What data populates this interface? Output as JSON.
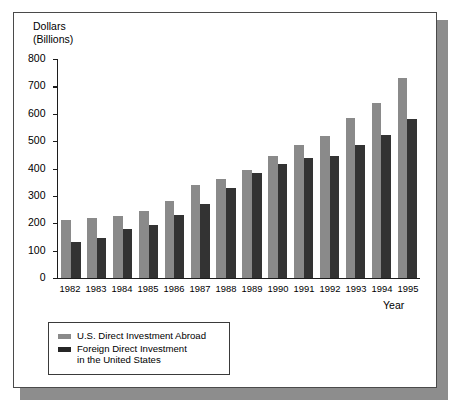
{
  "chart_data": {
    "type": "bar",
    "title": "",
    "subtitle": "",
    "xlabel": "Year",
    "ylabel": "Dollars\n(Billions)",
    "ylabel_line1": "Dollars",
    "ylabel_line2": "(Billions)",
    "categories": [
      "1982",
      "1983",
      "1984",
      "1985",
      "1986",
      "1987",
      "1988",
      "1989",
      "1990",
      "1991",
      "1992",
      "1993",
      "1994",
      "1995"
    ],
    "ylim": [
      0,
      800
    ],
    "yticks": [
      0,
      100,
      200,
      300,
      400,
      500,
      600,
      700,
      800
    ],
    "ytick_labels": [
      "0",
      "100",
      "200",
      "300",
      "400",
      "500",
      "600",
      "700",
      "800"
    ],
    "grid": false,
    "legend_position": "below-left",
    "series": [
      {
        "name": "U.S. Direct Investment Abroad",
        "color": "#8a8a8a",
        "values": [
          212,
          218,
          226,
          246,
          280,
          338,
          360,
          393,
          447,
          485,
          517,
          583,
          640,
          730
        ]
      },
      {
        "name": "Foreign Direct Investment\nin the United States",
        "color": "#333333",
        "values": [
          132,
          147,
          180,
          195,
          232,
          272,
          330,
          385,
          415,
          438,
          447,
          485,
          523,
          582
        ]
      }
    ],
    "annotations": []
  },
  "legend": {
    "items": [
      {
        "label": "U.S. Direct Investment Abroad",
        "swatch": "#8a8a8a"
      },
      {
        "label": "Foreign Direct Investment\nin the United States",
        "swatch": "#262626"
      }
    ]
  },
  "colors": {
    "series_light": "#8a8a8a",
    "series_dark": "#333333",
    "frame_border": "#4a4a4a",
    "frame_shadow": "#8d8d8d",
    "axis": "#1c1c1c",
    "background": "#ffffff"
  }
}
